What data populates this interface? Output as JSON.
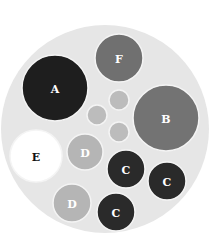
{
  "diagram": {
    "type": "packed-circles",
    "container": {
      "cx": 105,
      "cy": 129,
      "r": 104,
      "fill": "#e6e6e6"
    },
    "circles": [
      {
        "id": "A",
        "label": "A",
        "cx": 55,
        "cy": 88,
        "r": 33,
        "fill": "#1e1e1e",
        "text_color": "#ffffff"
      },
      {
        "id": "F",
        "label": "F",
        "cx": 119,
        "cy": 58,
        "r": 24,
        "fill": "#707070",
        "text_color": "#ffffff"
      },
      {
        "id": "B",
        "label": "B",
        "cx": 166,
        "cy": 118,
        "r": 33,
        "fill": "#737373",
        "text_color": "#ffffff"
      },
      {
        "id": "E",
        "label": "E",
        "cx": 36,
        "cy": 156,
        "r": 26,
        "fill": "#ffffff",
        "text_color": "#111111"
      },
      {
        "id": "D1",
        "label": "D",
        "cx": 85,
        "cy": 152,
        "r": 18,
        "fill": "#b5b5b5",
        "text_color": "#ffffff"
      },
      {
        "id": "D2",
        "label": "D",
        "cx": 72,
        "cy": 203,
        "r": 19,
        "fill": "#b5b5b5",
        "text_color": "#ffffff"
      },
      {
        "id": "C1",
        "label": "C",
        "cx": 126,
        "cy": 169,
        "r": 19,
        "fill": "#2a2a2a",
        "text_color": "#ffffff"
      },
      {
        "id": "C2",
        "label": "C",
        "cx": 167,
        "cy": 181,
        "r": 19,
        "fill": "#2a2a2a",
        "text_color": "#ffffff"
      },
      {
        "id": "C3",
        "label": "C",
        "cx": 116,
        "cy": 212,
        "r": 19,
        "fill": "#2a2a2a",
        "text_color": "#ffffff"
      },
      {
        "id": "s1",
        "label": "",
        "cx": 119,
        "cy": 100,
        "r": 10,
        "fill": "#bcbcbc",
        "text_color": "#ffffff"
      },
      {
        "id": "s2",
        "label": "",
        "cx": 97,
        "cy": 115,
        "r": 10,
        "fill": "#bcbcbc",
        "text_color": "#ffffff"
      },
      {
        "id": "s3",
        "label": "",
        "cx": 119,
        "cy": 132,
        "r": 10,
        "fill": "#bcbcbc",
        "text_color": "#ffffff"
      }
    ],
    "stroke_color": "#f4f4f4"
  }
}
